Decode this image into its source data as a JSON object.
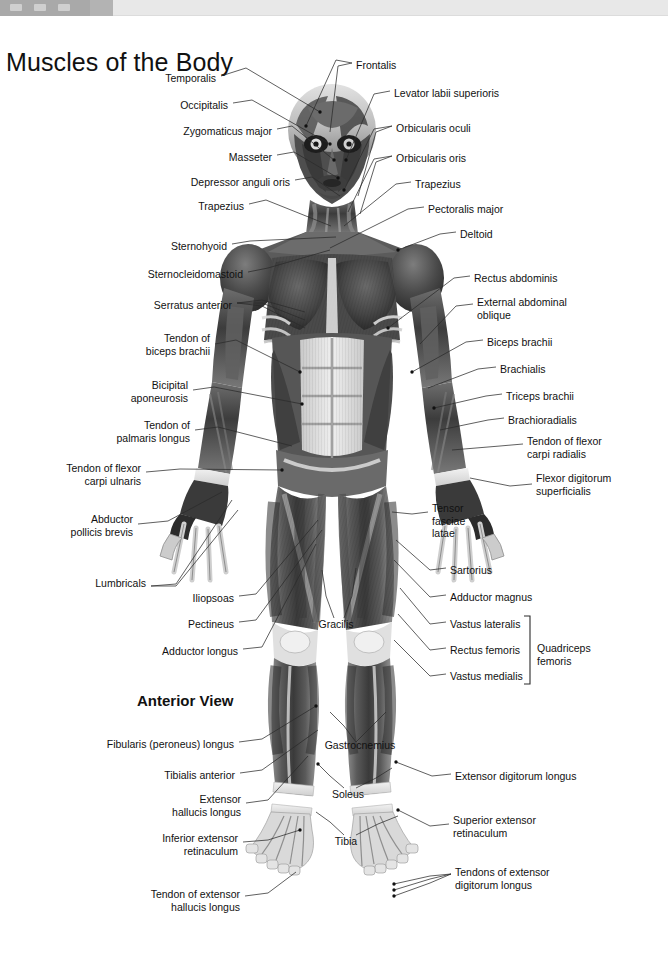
{
  "window": {
    "titlebar_visible": true,
    "titlebar_color": "#a9a9a9",
    "background_color": "#e8e8e8"
  },
  "page": {
    "title": "Muscles of the Body",
    "view_caption": "Anterior View",
    "background_color": "#ffffff",
    "text_color": "#111111",
    "leader_line_color": "#2b2b2b"
  },
  "figure": {
    "name": "anterior-muscular-system-figure",
    "style": "grayscale"
  },
  "bracket": {
    "label": "Quadriceps\nfemoris",
    "label_line1": "Quadriceps",
    "label_line2": "femoris",
    "groups": [
      "Vastus lateralis",
      "Rectus femoris",
      "Vastus medialis"
    ]
  },
  "labels_left": [
    {
      "id": "temporalis",
      "text": "Temporalis",
      "x": 216,
      "y": 78,
      "align": "right"
    },
    {
      "id": "occipitalis",
      "text": "Occipitalis",
      "x": 228,
      "y": 105,
      "align": "right"
    },
    {
      "id": "zygomaticus-major",
      "text": "Zygomaticus major",
      "x": 272,
      "y": 131,
      "align": "right"
    },
    {
      "id": "masseter",
      "text": "Masseter",
      "x": 272,
      "y": 157,
      "align": "right"
    },
    {
      "id": "depressor-anguli-oris",
      "text": "Depressor anguli oris",
      "x": 290,
      "y": 182,
      "align": "right"
    },
    {
      "id": "trapezius-left",
      "text": "Trapezius",
      "x": 244,
      "y": 206,
      "align": "right"
    },
    {
      "id": "sternohyoid",
      "text": "Sternohyoid",
      "x": 227,
      "y": 246,
      "align": "right"
    },
    {
      "id": "sternocleidomastoid",
      "text": "Sternocleidomastoid",
      "x": 243,
      "y": 274,
      "align": "right"
    },
    {
      "id": "serratus-anterior",
      "text": "Serratus anterior",
      "x": 232,
      "y": 305,
      "align": "right"
    },
    {
      "id": "tendon-of-biceps-brachii",
      "text": "Tendon of\nbiceps brachii",
      "x": 210,
      "y": 338,
      "align": "right"
    },
    {
      "id": "bicipital-aponeurosis",
      "text": "Bicipital\naponeurosis",
      "x": 188,
      "y": 385,
      "align": "right"
    },
    {
      "id": "tendon-of-palmaris-longus",
      "text": "Tendon of\npalmaris longus",
      "x": 190,
      "y": 425,
      "align": "right"
    },
    {
      "id": "tendon-of-flexor-carpi-ulnaris",
      "text": "Tendon of flexor\ncarpi ulnaris",
      "x": 141,
      "y": 468,
      "align": "right"
    },
    {
      "id": "abductor-pollicis-brevis",
      "text": "Abductor\npollicis brevis",
      "x": 133,
      "y": 519,
      "align": "right"
    },
    {
      "id": "lumbricals",
      "text": "Lumbricals",
      "x": 146,
      "y": 583,
      "align": "right"
    },
    {
      "id": "iliopsoas",
      "text": "Iliopsoas",
      "x": 234,
      "y": 598,
      "align": "right"
    },
    {
      "id": "pectineus",
      "text": "Pectineus",
      "x": 234,
      "y": 624,
      "align": "right"
    },
    {
      "id": "adductor-longus",
      "text": "Adductor longus",
      "x": 238,
      "y": 651,
      "align": "right"
    },
    {
      "id": "fibularis-peroneus-longus",
      "text": "Fibularis (peroneus) longus",
      "x": 234,
      "y": 744,
      "align": "right"
    },
    {
      "id": "tibialis-anterior",
      "text": "Tibialis anterior",
      "x": 235,
      "y": 775,
      "align": "right"
    },
    {
      "id": "extensor-hallucis-longus",
      "text": "Extensor\nhallucis longus",
      "x": 241,
      "y": 799,
      "align": "right"
    },
    {
      "id": "inferior-extensor-retinaculum",
      "text": "Inferior extensor\nretinaculum",
      "x": 238,
      "y": 838,
      "align": "right"
    },
    {
      "id": "tendon-of-extensor-hallucis-longus",
      "text": "Tendon of extensor\nhallucis longus",
      "x": 240,
      "y": 894,
      "align": "right"
    }
  ],
  "labels_right": [
    {
      "id": "frontalis",
      "text": "Frontalis",
      "x": 356,
      "y": 65,
      "align": "left"
    },
    {
      "id": "levator-labii-superioris",
      "text": "Levator labii superioris",
      "x": 394,
      "y": 93,
      "align": "left"
    },
    {
      "id": "orbicularis-oculi",
      "text": "Orbicularis oculi",
      "x": 396,
      "y": 128,
      "align": "left"
    },
    {
      "id": "orbicularis-oris",
      "text": "Orbicularis oris",
      "x": 396,
      "y": 158,
      "align": "left"
    },
    {
      "id": "trapezius-right",
      "text": "Trapezius",
      "x": 415,
      "y": 184,
      "align": "left"
    },
    {
      "id": "pectoralis-major",
      "text": "Pectoralis major",
      "x": 428,
      "y": 209,
      "align": "left"
    },
    {
      "id": "deltoid",
      "text": "Deltoid",
      "x": 460,
      "y": 234,
      "align": "left"
    },
    {
      "id": "rectus-abdominis",
      "text": "Rectus abdominis",
      "x": 474,
      "y": 278,
      "align": "left"
    },
    {
      "id": "external-abdominal-oblique",
      "text": "External abdominal\noblique",
      "x": 477,
      "y": 302,
      "align": "left"
    },
    {
      "id": "biceps-brachii",
      "text": "Biceps brachii",
      "x": 487,
      "y": 342,
      "align": "left"
    },
    {
      "id": "brachialis",
      "text": "Brachialis",
      "x": 500,
      "y": 369,
      "align": "left"
    },
    {
      "id": "triceps-brachii",
      "text": "Triceps brachii",
      "x": 506,
      "y": 396,
      "align": "left"
    },
    {
      "id": "brachioradialis",
      "text": "Brachioradialis",
      "x": 508,
      "y": 420,
      "align": "left"
    },
    {
      "id": "tendon-of-flexor-carpi-radialis",
      "text": "Tendon of flexor\ncarpi radialis",
      "x": 527,
      "y": 441,
      "align": "left"
    },
    {
      "id": "flexor-digitorum-superficialis",
      "text": "Flexor digitorum\nsuperficialis",
      "x": 536,
      "y": 478,
      "align": "left"
    },
    {
      "id": "tensor-fasciae-latae",
      "text": "Tensor\nfasciae\nlatae",
      "x": 432,
      "y": 508,
      "align": "left"
    },
    {
      "id": "sartorius",
      "text": "Sartorius",
      "x": 450,
      "y": 570,
      "align": "left"
    },
    {
      "id": "adductor-magnus",
      "text": "Adductor magnus",
      "x": 450,
      "y": 597,
      "align": "left"
    },
    {
      "id": "vastus-lateralis",
      "text": "Vastus lateralis",
      "x": 450,
      "y": 624,
      "align": "left"
    },
    {
      "id": "rectus-femoris",
      "text": "Rectus femoris",
      "x": 450,
      "y": 650,
      "align": "left"
    },
    {
      "id": "vastus-medialis",
      "text": "Vastus medialis",
      "x": 450,
      "y": 676,
      "align": "left"
    },
    {
      "id": "extensor-digitorum-longus",
      "text": "Extensor digitorum longus",
      "x": 455,
      "y": 776,
      "align": "left"
    },
    {
      "id": "superior-extensor-retinaculum",
      "text": "Superior extensor\nretinaculum",
      "x": 453,
      "y": 820,
      "align": "left"
    },
    {
      "id": "tendons-of-extensor-digitorum-longus",
      "text": "Tendons of extensor\ndigitorum longus",
      "x": 455,
      "y": 872,
      "align": "left"
    }
  ],
  "labels_center": [
    {
      "id": "gracilis",
      "text": "Gracilis",
      "x": 336,
      "y": 624,
      "align": "center"
    },
    {
      "id": "gastrocnemius",
      "text": "Gastrocnemius",
      "x": 360,
      "y": 745,
      "align": "center"
    },
    {
      "id": "soleus",
      "text": "Soleus",
      "x": 345,
      "y": 794,
      "align": "center"
    },
    {
      "id": "tibia",
      "text": "Tibia",
      "x": 344,
      "y": 841,
      "align": "center"
    }
  ]
}
